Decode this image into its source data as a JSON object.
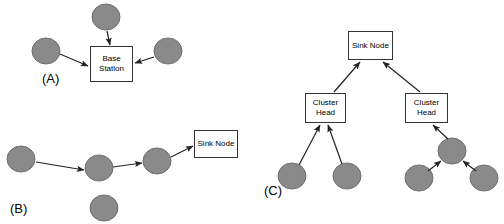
{
  "figure": {
    "background_color": "#ffffff",
    "node_fill_color": "#8a8a8a",
    "node_stroke_color": "#6f6f6f",
    "box_fill_color": "#ffffff",
    "box_stroke_color": "#333333",
    "arrow_color": "#222222",
    "width": 504,
    "height": 224
  },
  "panels": [
    {
      "id": "panel-a",
      "label": "(A)",
      "label_x": 42,
      "label_y": 72,
      "boxes": [
        {
          "name": "base-station-box",
          "text": "Base\nStation",
          "x": 90,
          "y": 46,
          "w": 43,
          "h": 36
        }
      ],
      "nodes": [
        {
          "name": "sensor-node-a-top",
          "cx": 106,
          "cy": 17,
          "rx": 14,
          "ry": 13
        },
        {
          "name": "sensor-node-a-left",
          "cx": 46,
          "cy": 51,
          "rx": 14,
          "ry": 13
        },
        {
          "name": "sensor-node-a-right",
          "cx": 168,
          "cy": 51,
          "rx": 14,
          "ry": 13
        }
      ],
      "arrows": [
        {
          "name": "arrow-a-top-to-base",
          "x1": 107,
          "y1": 31,
          "x2": 110,
          "y2": 45
        },
        {
          "name": "arrow-a-left-to-base",
          "x1": 60,
          "y1": 54,
          "x2": 88,
          "y2": 66
        },
        {
          "name": "arrow-a-right-to-base",
          "x1": 154,
          "y1": 57,
          "x2": 135,
          "y2": 63
        }
      ]
    },
    {
      "id": "panel-b",
      "label": "(B)",
      "label_x": 10,
      "label_y": 202,
      "boxes": [
        {
          "name": "sink-node-box-b",
          "text": "Sink Node",
          "x": 194,
          "y": 130,
          "w": 44,
          "h": 28
        }
      ],
      "nodes": [
        {
          "name": "sensor-node-b-1",
          "cx": 21,
          "cy": 159,
          "rx": 14,
          "ry": 13
        },
        {
          "name": "sensor-node-b-2",
          "cx": 99,
          "cy": 168,
          "rx": 14,
          "ry": 13
        },
        {
          "name": "sensor-node-b-3",
          "cx": 157,
          "cy": 161,
          "rx": 14,
          "ry": 13
        },
        {
          "name": "sensor-node-b-isolated",
          "cx": 104,
          "cy": 208,
          "rx": 14,
          "ry": 13
        }
      ],
      "arrows": [
        {
          "name": "arrow-b-1-to-2",
          "x1": 36,
          "y1": 162,
          "x2": 84,
          "y2": 170
        },
        {
          "name": "arrow-b-2-to-3",
          "x1": 113,
          "y1": 167,
          "x2": 142,
          "y2": 163
        },
        {
          "name": "arrow-b-3-to-sink",
          "x1": 171,
          "y1": 157,
          "x2": 193,
          "y2": 146
        }
      ]
    },
    {
      "id": "panel-c",
      "label": "(C)",
      "label_x": 264,
      "label_y": 184,
      "boxes": [
        {
          "name": "sink-node-box-c",
          "text": "Sink Node",
          "x": 348,
          "y": 31,
          "w": 45,
          "h": 29
        },
        {
          "name": "cluster-head-box-left",
          "text": "Cluster\nHead",
          "x": 305,
          "y": 93,
          "w": 41,
          "h": 30
        },
        {
          "name": "cluster-head-box-right",
          "text": "Cluster\nHead",
          "x": 405,
          "y": 93,
          "w": 43,
          "h": 30
        }
      ],
      "nodes": [
        {
          "name": "sensor-node-c-left-1",
          "cx": 292,
          "cy": 176,
          "rx": 14,
          "ry": 13
        },
        {
          "name": "sensor-node-c-left-2",
          "cx": 347,
          "cy": 176,
          "rx": 14,
          "ry": 13
        },
        {
          "name": "sensor-node-c-relay",
          "cx": 452,
          "cy": 151,
          "rx": 14,
          "ry": 13
        },
        {
          "name": "sensor-node-c-right-1",
          "cx": 419,
          "cy": 178,
          "rx": 14,
          "ry": 13
        },
        {
          "name": "sensor-node-c-right-2",
          "cx": 484,
          "cy": 178,
          "rx": 14,
          "ry": 13
        }
      ],
      "arrows": [
        {
          "name": "arrow-c-left-head-to-sink",
          "x1": 334,
          "y1": 92,
          "x2": 360,
          "y2": 62
        },
        {
          "name": "arrow-c-right-head-to-sink",
          "x1": 420,
          "y1": 92,
          "x2": 383,
          "y2": 62
        },
        {
          "name": "arrow-c-left-1-to-head",
          "x1": 299,
          "y1": 165,
          "x2": 320,
          "y2": 125
        },
        {
          "name": "arrow-c-left-2-to-head",
          "x1": 342,
          "y1": 164,
          "x2": 328,
          "y2": 125
        },
        {
          "name": "arrow-c-relay-to-right-head",
          "x1": 448,
          "y1": 139,
          "x2": 433,
          "y2": 125
        },
        {
          "name": "arrow-c-right-1-to-relay",
          "x1": 428,
          "y1": 171,
          "x2": 441,
          "y2": 161
        },
        {
          "name": "arrow-c-right-2-to-relay",
          "x1": 476,
          "y1": 171,
          "x2": 463,
          "y2": 161
        }
      ]
    }
  ]
}
